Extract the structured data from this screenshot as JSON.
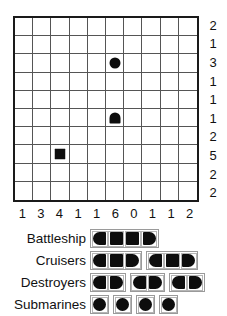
{
  "puzzle": {
    "type": "battleship-solitaire",
    "grid": {
      "rows": 10,
      "cols": 10,
      "row_clues": [
        2,
        1,
        3,
        1,
        1,
        1,
        2,
        5,
        2,
        2
      ],
      "col_clues": [
        1,
        3,
        4,
        1,
        1,
        6,
        0,
        1,
        1,
        2
      ],
      "given_pieces": [
        {
          "row": 3,
          "col": 6,
          "shape": "sub",
          "name": "submarine-circle"
        },
        {
          "row": 6,
          "col": 6,
          "shape": "end-up",
          "name": "ship-end-up"
        },
        {
          "row": 8,
          "col": 3,
          "shape": "square",
          "name": "ship-middle-square"
        }
      ]
    }
  },
  "fleet": {
    "rows": [
      {
        "label": "Battleship",
        "ship_size": 4,
        "count": 1,
        "ships": [
          [
            "left",
            "mid",
            "mid",
            "right"
          ]
        ]
      },
      {
        "label": "Cruisers",
        "ship_size": 3,
        "count": 2,
        "ships": [
          [
            "left",
            "mid",
            "right"
          ],
          [
            "left",
            "mid",
            "right"
          ]
        ]
      },
      {
        "label": "Destroyers",
        "ship_size": 2,
        "count": 3,
        "ships": [
          [
            "left",
            "right"
          ],
          [
            "left",
            "right"
          ],
          [
            "left",
            "right"
          ]
        ]
      },
      {
        "label": "Submarines",
        "ship_size": 1,
        "count": 4,
        "ships": [
          [
            "round"
          ],
          [
            "round"
          ],
          [
            "round"
          ],
          [
            "round"
          ]
        ]
      }
    ]
  },
  "colors": {
    "ink": "#0d0d0d",
    "grid_line": "#555555",
    "grid_border": "#1a1a1a",
    "legend_cell_border": "#b5b5b5",
    "background": "#ffffff"
  }
}
